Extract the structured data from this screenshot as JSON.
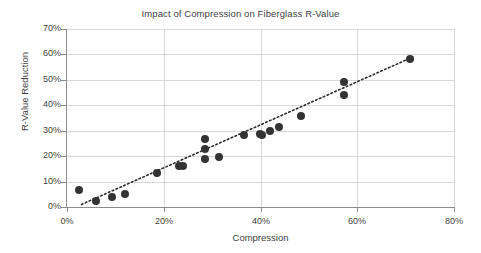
{
  "chart_data": {
    "type": "scatter",
    "title": "Impact of Compression on Fiberglass R-Value",
    "xlabel": "Compression",
    "ylabel": "R-Value Reduction",
    "xlim": [
      0,
      80
    ],
    "ylim": [
      0,
      70
    ],
    "grid": true,
    "legend": null,
    "x_ticks": [
      "0%",
      "20%",
      "40%",
      "60%",
      "80%"
    ],
    "x_tick_values": [
      0,
      20,
      40,
      60,
      80
    ],
    "y_ticks": [
      "0%",
      "10%",
      "20%",
      "30%",
      "40%",
      "50%",
      "60%",
      "70%"
    ],
    "y_tick_values": [
      0,
      10,
      20,
      30,
      40,
      50,
      60,
      70
    ],
    "marker": {
      "shape": "circle",
      "color": "#333333",
      "size": 8
    },
    "trendline": {
      "style": "dotted",
      "color": "#2b2b2b",
      "x_start": 3.0,
      "y_start": 1.0,
      "x_end": 71.5,
      "y_end": 59.0
    },
    "points": [
      {
        "x": 2.5,
        "y": 6.7
      },
      {
        "x": 6.0,
        "y": 2.5
      },
      {
        "x": 9.3,
        "y": 4.0
      },
      {
        "x": 12.0,
        "y": 5.3
      },
      {
        "x": 18.6,
        "y": 13.5
      },
      {
        "x": 23.2,
        "y": 16.1
      },
      {
        "x": 23.9,
        "y": 16.2
      },
      {
        "x": 28.6,
        "y": 26.6
      },
      {
        "x": 28.6,
        "y": 22.8
      },
      {
        "x": 28.6,
        "y": 18.8
      },
      {
        "x": 31.5,
        "y": 19.6
      },
      {
        "x": 36.6,
        "y": 28.3
      },
      {
        "x": 39.8,
        "y": 28.8
      },
      {
        "x": 40.3,
        "y": 28.3
      },
      {
        "x": 41.9,
        "y": 29.8
      },
      {
        "x": 43.8,
        "y": 31.3
      },
      {
        "x": 48.3,
        "y": 35.9
      },
      {
        "x": 57.2,
        "y": 49.0
      },
      {
        "x": 57.3,
        "y": 44.2
      },
      {
        "x": 70.8,
        "y": 58.3
      }
    ]
  },
  "colors": {
    "axis": "#8c8c8c",
    "grid": "#d8d8d8",
    "text": "#3f3f3f",
    "marker": "#333333",
    "background": "#ffffff"
  }
}
